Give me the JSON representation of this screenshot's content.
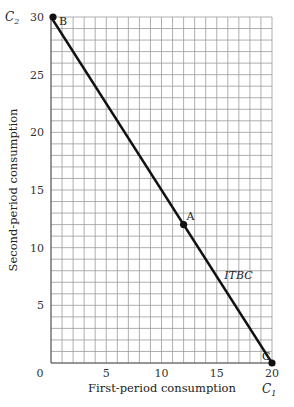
{
  "chart_data": {
    "type": "line",
    "title": "",
    "xlabel": "First-period consumption",
    "ylabel": "Second-period consumption",
    "x_symbol": "C",
    "x_symbol_sub": "1",
    "y_symbol": "C",
    "y_symbol_sub": "2",
    "xlim": [
      0,
      20
    ],
    "ylim": [
      0,
      30
    ],
    "x_ticks": [
      0,
      5,
      10,
      15,
      20
    ],
    "y_ticks": [
      5,
      10,
      15,
      20,
      25,
      30
    ],
    "x_tick_labels": [
      "0",
      "5",
      "10",
      "15",
      "20"
    ],
    "y_tick_labels": [
      "5",
      "10",
      "15",
      "20",
      "25",
      "30"
    ],
    "grid": true,
    "grid_step": 1,
    "series": [
      {
        "name": "ITBC",
        "x": [
          0,
          20
        ],
        "y": [
          30,
          0
        ],
        "color": "#111111"
      }
    ],
    "points": [
      {
        "label": "B",
        "x": 0,
        "y": 30
      },
      {
        "label": "A",
        "x": 12,
        "y": 12
      },
      {
        "label": "C",
        "x": 20,
        "y": 0
      }
    ],
    "annotations": [
      {
        "text": "ITBC",
        "x": 15.5,
        "y": 7.5,
        "italic": true
      }
    ]
  }
}
